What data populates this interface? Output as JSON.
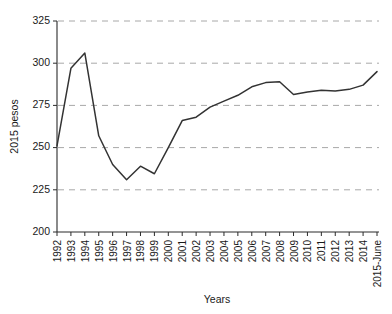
{
  "chart_data": {
    "type": "line",
    "title": "",
    "xlabel": "Years",
    "ylabel": "2015 pesos",
    "ylim": [
      200,
      325
    ],
    "yticks": [
      200,
      225,
      250,
      275,
      300,
      325
    ],
    "grid": true,
    "legend": "none",
    "line_color": "#333333",
    "grid_color": "#a8a8a8",
    "axis_color": "#2b2b2b",
    "categories": [
      "1992",
      "1993",
      "1994",
      "1995",
      "1996",
      "1997",
      "1998",
      "1999",
      "2000",
      "2001",
      "2002",
      "2003",
      "2004",
      "2005",
      "2006",
      "2007",
      "2008",
      "2009",
      "2010",
      "2011",
      "2012",
      "2013",
      "2014",
      "2015-June"
    ],
    "values": [
      251,
      297,
      306,
      257,
      240,
      231,
      239,
      234.5,
      250,
      266,
      268,
      274,
      277.5,
      281,
      286,
      288.5,
      289,
      281.5,
      283,
      284,
      283.5,
      284.5,
      287,
      295
    ],
    "series": [
      {
        "name": "2015 pesos",
        "values": [
          251,
          297,
          306,
          257,
          240,
          231,
          239,
          234.5,
          250,
          266,
          268,
          274,
          277.5,
          281,
          286,
          288.5,
          289,
          281.5,
          283,
          284,
          283.5,
          284.5,
          287,
          295
        ]
      }
    ]
  }
}
